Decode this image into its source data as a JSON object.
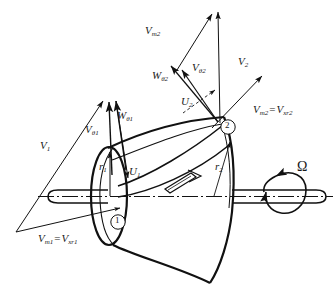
{
  "figure": {
    "background_color": "#ffffff",
    "line_color": "#111111",
    "width": 333,
    "height": 305
  },
  "labels": {
    "V1": "V",
    "V1_sub": "1",
    "Vtheta1": "V",
    "Vtheta1_sub": "θ1",
    "Wtheta1": "W",
    "Wtheta1_sub": "θ1",
    "r1": "r",
    "r1_sub": "1",
    "U1": "U",
    "U1_sub": "1",
    "Vm1_eq": "V",
    "Vm1_sub": "m1",
    "Vm1_equals": "=",
    "Vxr1": "V",
    "Vxr1_sub": "xr1",
    "Vm2": "V",
    "Vm2_sub": "m2",
    "V2": "V",
    "V2_sub": "2",
    "Wtheta2": "W",
    "Wtheta2_sub": "θ2",
    "Vtheta2": "V",
    "Vtheta2_sub": "θ2",
    "U2": "U",
    "U2_sub": "2",
    "Vm2r_eq": "V",
    "Vm2r_sub": "m2",
    "Vm2r_equals": "=",
    "Vxr2": "V",
    "Vxr2_sub": "xr2",
    "r2": "r",
    "r2_sub": "2",
    "omega": "Ω",
    "station1": "1",
    "station2": "2"
  },
  "stations": {
    "inlet_marker": "1",
    "outlet_marker": "2"
  },
  "rotation": {
    "symbol": "Ω",
    "description": "shaft angular velocity"
  }
}
